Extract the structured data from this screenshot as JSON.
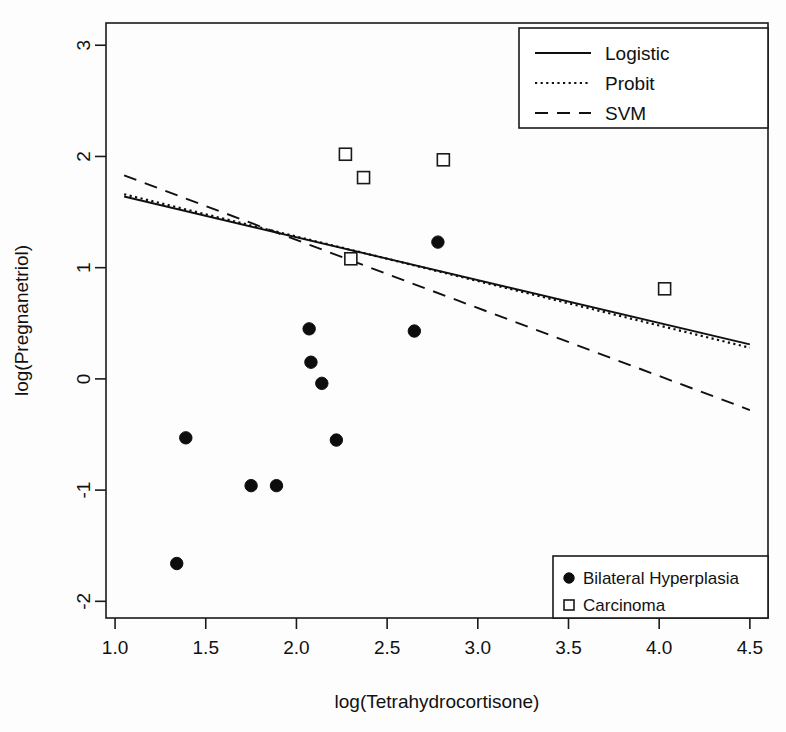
{
  "chart_data": {
    "type": "scatter",
    "title": "",
    "xlabel": "log(Tetrahydrocortisone)",
    "ylabel": "log(Pregnanetriol)",
    "xlim": [
      0.95,
      4.6
    ],
    "ylim": [
      -2.15,
      3.2
    ],
    "xticks": [
      "1.0",
      "1.5",
      "2.0",
      "2.5",
      "3.0",
      "3.5",
      "4.0",
      "4.5"
    ],
    "xtick_values": [
      1.0,
      1.5,
      2.0,
      2.5,
      3.0,
      3.5,
      4.0,
      4.5
    ],
    "yticks": [
      "3",
      "2",
      "1",
      "0",
      "-1",
      "-2"
    ],
    "ytick_values": [
      3,
      2,
      1,
      0,
      -1,
      -2
    ],
    "grid": false,
    "series": [
      {
        "name": "Bilateral Hyperplasia",
        "marker": "filled-circle",
        "points": [
          [
            2.07,
            0.45
          ],
          [
            2.65,
            0.43
          ],
          [
            2.08,
            0.15
          ],
          [
            2.14,
            -0.04
          ],
          [
            1.39,
            -0.53
          ],
          [
            2.22,
            -0.55
          ],
          [
            1.75,
            -0.96
          ],
          [
            1.89,
            -0.96
          ],
          [
            1.34,
            -1.66
          ],
          [
            2.78,
            1.23
          ]
        ]
      },
      {
        "name": "Carcinoma",
        "marker": "open-square",
        "points": [
          [
            2.27,
            2.02
          ],
          [
            2.37,
            1.81
          ],
          [
            2.81,
            1.97
          ],
          [
            2.3,
            1.08
          ],
          [
            4.03,
            0.81
          ]
        ]
      }
    ],
    "lines": [
      {
        "name": "Logistic",
        "style": "solid",
        "x": [
          1.05,
          4.5
        ],
        "y": [
          1.64,
          0.31
        ]
      },
      {
        "name": "Probit",
        "style": "dotted",
        "x": [
          1.05,
          4.5
        ],
        "y": [
          1.66,
          0.28
        ]
      },
      {
        "name": "SVM",
        "style": "dashed",
        "x": [
          1.05,
          4.5
        ],
        "y": [
          1.83,
          -0.28
        ]
      }
    ],
    "legend_lines": {
      "position": "top-right",
      "entries": [
        {
          "label": "Logistic",
          "style": "solid"
        },
        {
          "label": "Probit",
          "style": "dotted"
        },
        {
          "label": "SVM",
          "style": "dashed"
        }
      ]
    },
    "legend_points": {
      "position": "bottom-right",
      "entries": [
        {
          "label": "Bilateral Hyperplasia",
          "marker": "filled-circle"
        },
        {
          "label": "Carcinoma",
          "marker": "open-square"
        }
      ]
    },
    "colors": {
      "line": "#101010",
      "marker_fill": "#0d0d0d",
      "marker_open": "#ffffff",
      "axis": "#1a1a1a",
      "background": "#ffffff"
    }
  }
}
